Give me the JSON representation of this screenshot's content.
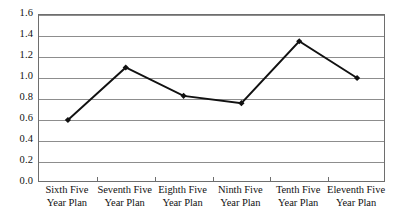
{
  "chart_data": {
    "type": "line",
    "title": "",
    "subtitle": "",
    "xlabel": "",
    "ylabel": "",
    "categories": [
      "Sixth Five Year Plan",
      "Seventh Five Year Plan",
      "Eighth Five Year Plan",
      "Ninth Five Year Plan",
      "Tenth Five Year Plan",
      "Eleventh Five Year Plan"
    ],
    "category_lines": [
      [
        "Sixth Five",
        "Year Plan"
      ],
      [
        "Seventh Five",
        "Year Plan"
      ],
      [
        "Eighth Five",
        "Year Plan"
      ],
      [
        "Ninth Five",
        "Year Plan"
      ],
      [
        "Tenth Five",
        "Year Plan"
      ],
      [
        "Eleventh Five",
        "Year Plan"
      ]
    ],
    "values": [
      0.6,
      1.1,
      0.83,
      0.76,
      1.35,
      1.0
    ],
    "ylim": [
      0.0,
      1.6
    ],
    "ytick_values": [
      0.0,
      0.2,
      0.4,
      0.6,
      0.8,
      1.0,
      1.2,
      1.4,
      1.6
    ],
    "ytick_labels": [
      "0.0",
      "0.2",
      "0.4",
      "0.6",
      "0.8",
      "1.0",
      "1.2",
      "1.4",
      "1.6"
    ],
    "grid": "horizontal",
    "legend": "none",
    "marker": "diamond",
    "line_color": "#111111",
    "marker_color": "#111111",
    "grid_color": "#8d8d8d",
    "frame_color": "#6e6e6e",
    "background": "#ffffff"
  }
}
